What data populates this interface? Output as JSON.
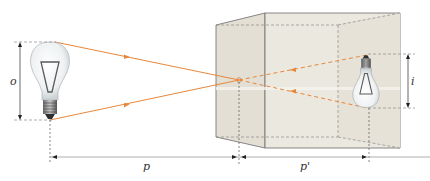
{
  "diagram": {
    "type": "pinhole-camera-optics",
    "labels": {
      "object_height": "o",
      "image_height": "i",
      "object_distance": "p",
      "image_distance": "p'"
    },
    "elements": {
      "object": "light bulb (upright)",
      "camera": "box with pinhole aperture",
      "image": "light bulb (inverted)",
      "rays": "two straight rays crossing at pinhole"
    },
    "colors": {
      "ray": "#e8873a",
      "box_front": "#e4e0d6",
      "box_side": "#ebe8df",
      "box_edge": "#6b6b6b",
      "dimension_line": "#444444"
    }
  }
}
